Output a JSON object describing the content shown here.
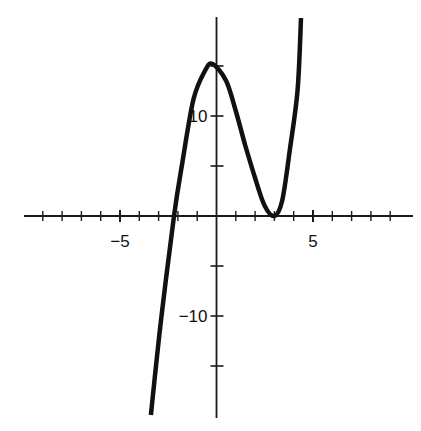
{
  "chart_data": {
    "type": "line",
    "title": "",
    "xlabel": "",
    "ylabel": "",
    "xlim": [
      -10,
      10
    ],
    "ylim": [
      -20,
      20
    ],
    "grid": false,
    "legend": null,
    "x_ticks": {
      "step": 1,
      "labels": [
        {
          "value": -5,
          "text": "−5"
        },
        {
          "value": 5,
          "text": "5"
        }
      ]
    },
    "y_ticks": {
      "step": 5,
      "labels": [
        {
          "value": 10,
          "text": "10"
        },
        {
          "value": -10,
          "text": "−10"
        }
      ]
    },
    "series": [
      {
        "name": "f(x)",
        "x": [
          -3.4,
          -2.85,
          -2.2,
          -1.8,
          -1.2,
          -0.6,
          -0.2,
          0.5,
          1.0,
          1.5,
          2.0,
          2.5,
          3.0,
          3.4,
          3.8,
          4.2,
          4.38
        ],
        "y": [
          -19.9,
          -10,
          0,
          5,
          11.6,
          14.5,
          15.2,
          13.5,
          10.5,
          7,
          3.8,
          1,
          0,
          1.5,
          6.6,
          12.6,
          19.8
        ]
      }
    ],
    "annotations": {
      "local_max": [
        -0.2,
        15.2
      ],
      "local_min": [
        3.0,
        0
      ],
      "x_intercepts": [
        -2.2,
        3.0
      ]
    }
  },
  "colors": {
    "background": "#ffffff",
    "axis": "#1a1a1a",
    "curve": "#111111"
  }
}
